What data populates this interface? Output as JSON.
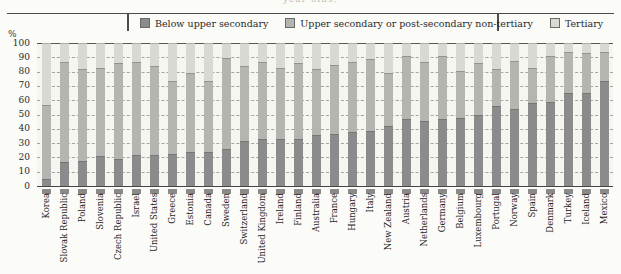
{
  "page": {
    "top_caption_fragment": "year-olds,"
  },
  "legend": {
    "items": [
      {
        "label": "Below upper secondary",
        "color": "#8b8b8b"
      },
      {
        "label": "Upper secondary or post-secondary non-tertiary",
        "color": "#b4b4b1"
      },
      {
        "label": "Tertiary",
        "color": "#d9d9d4"
      }
    ]
  },
  "y_axis": {
    "unit": "%",
    "ticks": [
      100,
      90,
      80,
      70,
      60,
      50,
      40,
      30,
      20,
      10,
      0
    ]
  },
  "chart_data": {
    "type": "bar",
    "stacked": true,
    "title": "",
    "xlabel": "",
    "ylabel": "%",
    "ylim": [
      0,
      100
    ],
    "grid": "dashed horizontal every 10",
    "legend_position": "top",
    "categories": [
      "Korea",
      "Slovak Republic",
      "Poland",
      "Slovenia",
      "Czech Republic",
      "Israel",
      "United States",
      "Greece",
      "Estonia",
      "Canada",
      "Sweden",
      "Switzerland",
      "United Kingdom",
      "Ireland",
      "Finland",
      "Australia",
      "France",
      "Hungary",
      "Italy",
      "New Zealand",
      "Austria",
      "Netherlands",
      "Germany",
      "Belgium",
      "Luxembourg",
      "Portugal",
      "Norway",
      "Spain",
      "Denmark",
      "Turkey",
      "Iceland",
      "Mexico"
    ],
    "series": [
      {
        "name": "Below upper secondary",
        "color": "#8b8b8b",
        "values": [
          4,
          16,
          17,
          20,
          18,
          21,
          21,
          22,
          23,
          23,
          25,
          31,
          32,
          32,
          32,
          35,
          36,
          37,
          38,
          41,
          46,
          45,
          46,
          47,
          49,
          55,
          53,
          57,
          58,
          64,
          64,
          73
        ]
      },
      {
        "name": "Upper secondary or post-secondary non-tertiary",
        "color": "#b4b4b1",
        "values": [
          52,
          70,
          64,
          62,
          67,
          65,
          62,
          51,
          55,
          50,
          64,
          52,
          54,
          50,
          53,
          46,
          48,
          49,
          50,
          37,
          44,
          41,
          44,
          33,
          36,
          26,
          34,
          25,
          32,
          29,
          28,
          20
        ]
      },
      {
        "name": "Tertiary",
        "color": "#d9d9d4",
        "values": [
          44,
          14,
          19,
          18,
          15,
          14,
          17,
          27,
          22,
          27,
          11,
          17,
          14,
          18,
          15,
          19,
          16,
          14,
          12,
          22,
          10,
          14,
          10,
          20,
          15,
          19,
          13,
          18,
          10,
          7,
          8,
          7
        ]
      }
    ]
  }
}
